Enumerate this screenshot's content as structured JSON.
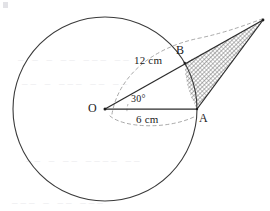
{
  "figure": {
    "type": "circle-sector-tangent-geometry-diagram",
    "labels": {
      "center": "O",
      "point_a": "A",
      "point_b": "B",
      "radius_label": "6 cm",
      "long_label": "12 cm",
      "angle_label": "30°"
    },
    "measurements": {
      "radius_cm": 6,
      "oblique_cm": 12,
      "angle_deg": 30
    },
    "colors": {
      "stroke": "#2b2b2b",
      "circle_stroke": "#3a3a3a",
      "dashed_stroke": "#8c8c8c",
      "hatch": "#6e6e6e",
      "ink": "#1b1b1b",
      "background": "#ffffff"
    },
    "geometry": {
      "circle": {
        "cx": 105,
        "cy": 109,
        "r": 92
      },
      "point_o": {
        "x": 105,
        "y": 109
      },
      "point_a": {
        "x": 197,
        "y": 109
      },
      "point_b": {
        "x": 184.7,
        "y": 63
      },
      "apex": {
        "x": 263,
        "y": 20
      }
    },
    "ghost_text": {
      "line1": "– – – –– ––– ––",
      "line2": "–– – ––– –– ––",
      "line3": "–– – –– –––– ––",
      "line4": "––– – –– –––"
    }
  }
}
